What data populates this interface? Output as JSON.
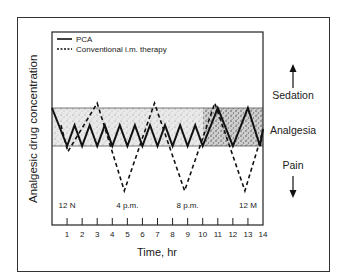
{
  "chart_data": {
    "type": "line",
    "title": "",
    "xlabel": "Time, hr",
    "ylabel": "Analgesic drug concentration",
    "xlim": [
      0,
      14
    ],
    "x_ticks": [
      1,
      2,
      3,
      4,
      5,
      6,
      7,
      8,
      9,
      10,
      11,
      12,
      13,
      14
    ],
    "clock_labels": [
      {
        "hour": 1,
        "label": "12 N"
      },
      {
        "hour": 5,
        "label": "4 p.m."
      },
      {
        "hour": 9,
        "label": "8 p.m."
      },
      {
        "hour": 13,
        "label": "12 M"
      }
    ],
    "zones": [
      {
        "label": "Sedation",
        "direction": "up"
      },
      {
        "label": "Analgesia",
        "band": "shaded"
      },
      {
        "label": "Pain",
        "direction": "down"
      }
    ],
    "legend": [
      {
        "label": "PCA",
        "style": "solid"
      },
      {
        "label": "Conventional i.m. therapy",
        "style": "dashed"
      }
    ],
    "y_scale_note": "relative concentration: 0 = bottom of analgesia band, 1 = top of analgesia band",
    "series": [
      {
        "name": "PCA",
        "style": "solid",
        "x": [
          0,
          1,
          1.5,
          2,
          2.5,
          3,
          3.5,
          4,
          4.5,
          5,
          5.5,
          6,
          6.5,
          7,
          7.5,
          8,
          8.5,
          9,
          9.5,
          10,
          11,
          12,
          13,
          13.8,
          14
        ],
        "y": [
          1.0,
          0.0,
          0.55,
          0.0,
          0.55,
          0.0,
          0.55,
          0.0,
          0.55,
          0.0,
          0.55,
          0.0,
          0.55,
          0.0,
          0.55,
          0.0,
          0.55,
          0.0,
          0.55,
          0.0,
          1.0,
          0.0,
          1.0,
          0.0,
          0.45
        ]
      },
      {
        "name": "Conventional i.m. therapy",
        "style": "dashed",
        "x": [
          0.6,
          1.05,
          3.0,
          4.8,
          6.8,
          8.8,
          10.8,
          12.8,
          14
        ],
        "y": [
          0.55,
          -0.15,
          1.13,
          -1.18,
          1.13,
          -1.18,
          1.13,
          -1.18,
          0.4
        ]
      }
    ]
  },
  "labels": {
    "ylabel": "Analgesic drug concentration",
    "xlabel": "Time, hr",
    "legend_pca": "PCA",
    "legend_im": "Conventional i.m. therapy",
    "sedation": "Sedation",
    "analgesia": "Analgesia",
    "pain": "Pain"
  }
}
